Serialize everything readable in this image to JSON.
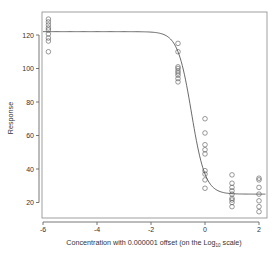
{
  "chart_data": {
    "type": "scatter",
    "title": "",
    "xlabel": "Concentration with 0.000001 offset (on the Log10 scale)",
    "xlabel_parts": {
      "before": "Concentration with 0.000001 offset (on the Log",
      "sub": "10",
      "after": " scale)"
    },
    "ylabel": "Response",
    "xlim": [
      -6,
      2.3
    ],
    "ylim": [
      13,
      133
    ],
    "x_ticks": [
      -6,
      -4,
      -2,
      0,
      2
    ],
    "x_tick_labels": [
      "-6",
      "-4",
      "-2",
      "0",
      "2"
    ],
    "y_ticks": [
      20,
      40,
      60,
      80,
      100,
      120
    ],
    "y_tick_labels": [
      "20",
      "40",
      "60",
      "80",
      "100",
      "120"
    ],
    "grid": false,
    "legend": null,
    "series": [
      {
        "name": "observations",
        "marker": "open-circle",
        "points": [
          {
            "x": -5.8,
            "y": 129.5
          },
          {
            "x": -5.8,
            "y": 127.8
          },
          {
            "x": -5.8,
            "y": 126
          },
          {
            "x": -5.8,
            "y": 124.2
          },
          {
            "x": -5.8,
            "y": 123
          },
          {
            "x": -5.8,
            "y": 120.6
          },
          {
            "x": -5.8,
            "y": 118.2
          },
          {
            "x": -5.8,
            "y": 116.4
          },
          {
            "x": -5.8,
            "y": 110
          },
          {
            "x": -1,
            "y": 115
          },
          {
            "x": -1,
            "y": 110
          },
          {
            "x": -1,
            "y": 101
          },
          {
            "x": -1,
            "y": 100
          },
          {
            "x": -1,
            "y": 98.5
          },
          {
            "x": -1,
            "y": 97.3
          },
          {
            "x": -1,
            "y": 96
          },
          {
            "x": -1,
            "y": 94
          },
          {
            "x": -1,
            "y": 92
          },
          {
            "x": 0,
            "y": 70
          },
          {
            "x": 0,
            "y": 61.5
          },
          {
            "x": 0,
            "y": 54.5
          },
          {
            "x": 0,
            "y": 51.5
          },
          {
            "x": 0,
            "y": 49
          },
          {
            "x": 0,
            "y": 39
          },
          {
            "x": 0,
            "y": 37
          },
          {
            "x": 0,
            "y": 33.5
          },
          {
            "x": 0,
            "y": 28.5
          },
          {
            "x": 1,
            "y": 36.5
          },
          {
            "x": 1,
            "y": 31.5
          },
          {
            "x": 1,
            "y": 29
          },
          {
            "x": 1,
            "y": 27
          },
          {
            "x": 1,
            "y": 25
          },
          {
            "x": 1,
            "y": 22.5
          },
          {
            "x": 1,
            "y": 21.5
          },
          {
            "x": 1,
            "y": 20
          },
          {
            "x": 1,
            "y": 17.5
          },
          {
            "x": 2,
            "y": 34.5
          },
          {
            "x": 2,
            "y": 33.5
          },
          {
            "x": 2,
            "y": 29
          },
          {
            "x": 2,
            "y": 25
          },
          {
            "x": 2,
            "y": 21
          },
          {
            "x": 2,
            "y": 17.5
          },
          {
            "x": 2,
            "y": 14.5
          }
        ]
      },
      {
        "name": "fitted curve",
        "type": "line",
        "model": "4-parameter logistic",
        "params": {
          "top": 122,
          "bottom": 25,
          "ec50_log10": -0.5,
          "hill": 1.7
        }
      }
    ]
  },
  "colors": {
    "axis": "#555555",
    "frame": "#777777",
    "points": "#555555",
    "curve": "#444444",
    "text": "#333333"
  }
}
